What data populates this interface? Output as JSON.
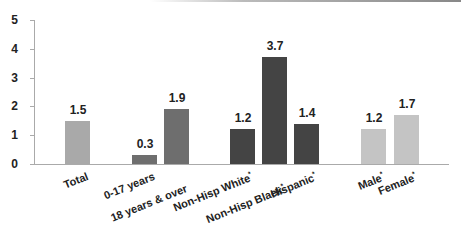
{
  "chart_data": {
    "type": "bar",
    "title": "",
    "xlabel": "",
    "ylabel": "",
    "ylim": [
      0,
      5
    ],
    "yticks": [
      0,
      1,
      2,
      3,
      4,
      5
    ],
    "grid": false,
    "legend": null,
    "categories": [
      "Total",
      "0-17 years",
      "18 years & over",
      "Non-Hisp White*",
      "Non-Hisp Black*",
      "Hispanic*",
      "Male*",
      "Female*"
    ],
    "values": [
      1.5,
      0.3,
      1.9,
      1.2,
      3.7,
      1.4,
      1.2,
      1.7
    ],
    "value_labels": [
      "1.5",
      "0.3",
      "1.9",
      "1.2",
      "3.7",
      "1.4",
      "1.2",
      "1.7"
    ],
    "groups": [
      {
        "name": "Total",
        "members": [
          "Total"
        ],
        "color": "#a9a9a9"
      },
      {
        "name": "Age",
        "members": [
          "0-17 years",
          "18 years & over"
        ],
        "color": "#6e6e6e"
      },
      {
        "name": "Race/Ethnicity",
        "members": [
          "Non-Hisp White*",
          "Non-Hisp Black*",
          "Hispanic*"
        ],
        "color": "#444444"
      },
      {
        "name": "Sex",
        "members": [
          "Male*",
          "Female*"
        ],
        "color": "#c4c4c4"
      }
    ]
  },
  "bars": [
    {
      "label": "Total",
      "value": 1.5,
      "value_text": "1.5",
      "x": 65,
      "color": "#a9a9a9"
    },
    {
      "label": "0-17 years",
      "value": 0.3,
      "value_text": "0.3",
      "x": 132,
      "color": "#6e6e6e"
    },
    {
      "label": "18 years & over",
      "value": 1.9,
      "value_text": "1.9",
      "x": 164,
      "color": "#6e6e6e"
    },
    {
      "label": "Non-Hisp White",
      "star": "*",
      "value": 1.2,
      "value_text": "1.2",
      "x": 230,
      "color": "#444444"
    },
    {
      "label": "Non-Hisp Black",
      "star": "*",
      "value": 3.7,
      "value_text": "3.7",
      "x": 262,
      "color": "#444444"
    },
    {
      "label": "Hispanic",
      "star": "*",
      "value": 1.4,
      "value_text": "1.4",
      "x": 294,
      "color": "#444444"
    },
    {
      "label": "Male",
      "star": "*",
      "value": 1.2,
      "value_text": "1.2",
      "x": 361,
      "color": "#c4c4c4"
    },
    {
      "label": "Female",
      "star": "*",
      "value": 1.7,
      "value_text": "1.7",
      "x": 394,
      "color": "#c4c4c4"
    }
  ],
  "axis": {
    "y_tick_labels": [
      "0",
      "1",
      "2",
      "3",
      "4",
      "5"
    ]
  }
}
